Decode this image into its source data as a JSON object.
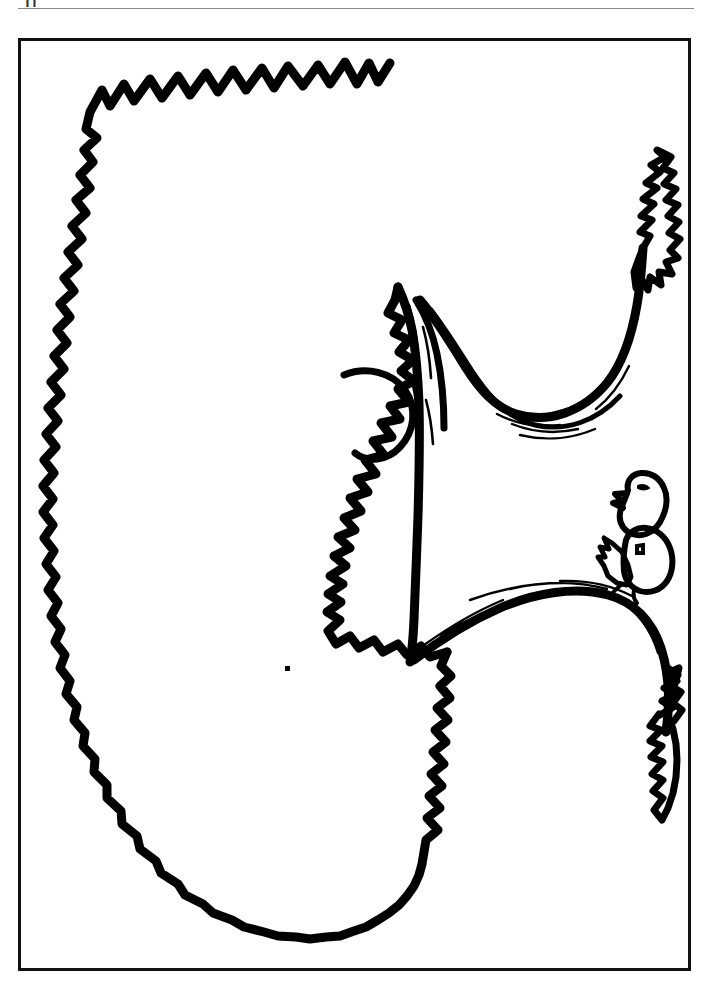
{
  "page": {
    "title": "Tree Coloring Page",
    "background_color": "#ffffff",
    "ink_color": "#000000",
    "width": 712,
    "height": 991
  },
  "header": {
    "crop_mark_text": "ii",
    "rule_color": "#8a8a8a"
  },
  "frame": {
    "name": "page-border",
    "stroke_color": "#111111",
    "x": 18,
    "y": 38,
    "width": 672,
    "height": 932,
    "stroke_width": 3
  },
  "illustration": {
    "subject": "deciduous tree with large leafy canopy, bare branches and two perched birds",
    "style": "black and white line art, coloring book",
    "parts": [
      {
        "name": "upper-canopy",
        "label": "Upper leafy canopy mass"
      },
      {
        "name": "lower-canopy",
        "label": "Lower leafy canopy mass"
      },
      {
        "name": "trunk",
        "label": "Trunk with bark texture lines"
      },
      {
        "name": "upper-branch",
        "label": "Upper branch curving to the right"
      },
      {
        "name": "lower-branch",
        "label": "Lower branch curving to the right"
      },
      {
        "name": "branch-tip-upper-right",
        "label": "Upper right leaf cluster on branch tip"
      },
      {
        "name": "branch-tip-lower-right",
        "label": "Lower right leaf cluster on branch tip"
      },
      {
        "name": "bird-upper",
        "label": "Upper perched bird"
      },
      {
        "name": "bird-lower",
        "label": "Lower perched bird"
      },
      {
        "name": "canopy-notch",
        "label": "Notched gap in canopy near trunk"
      },
      {
        "name": "scan-speck",
        "label": "Small scan artifact speck"
      }
    ]
  }
}
